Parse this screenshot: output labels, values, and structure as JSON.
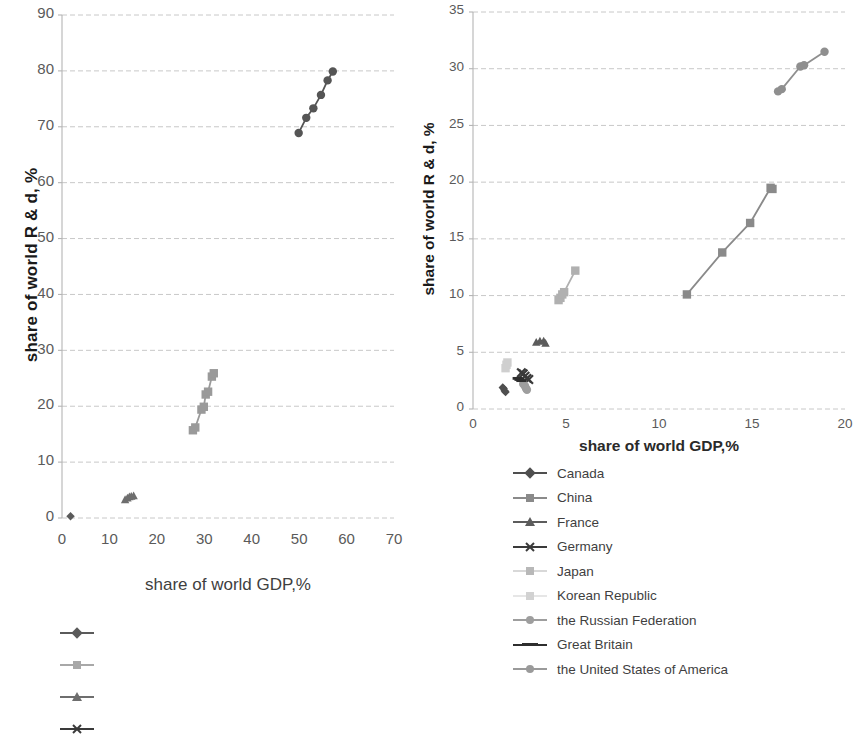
{
  "chart_data": [
    {
      "id": "chart-left",
      "type": "scatter",
      "title": "",
      "xlabel": "share of world GDP,%",
      "ylabel": "share of world R & d, %",
      "xlim": [
        0,
        70
      ],
      "ylim": [
        0,
        90
      ],
      "xticks": [
        0,
        10,
        20,
        30,
        40,
        50,
        60,
        70
      ],
      "yticks": [
        0,
        10,
        20,
        30,
        40,
        50,
        60,
        70,
        80,
        90
      ],
      "grid": "horizontal",
      "legend_position": "bottom-left (cropped, markers only)",
      "series": [
        {
          "name": "Canada",
          "color": "#5a5a5a",
          "marker": "diamond",
          "points": [
            [
              1.8,
              0.3
            ]
          ]
        },
        {
          "name": "China",
          "color": "#9a9a9a",
          "marker": "square",
          "points": [
            [
              27.6,
              15.7
            ],
            [
              28.1,
              16.2
            ],
            [
              29.4,
              19.4
            ],
            [
              29.9,
              19.9
            ],
            [
              30.3,
              22.1
            ],
            [
              30.8,
              22.6
            ],
            [
              31.6,
              25.3
            ],
            [
              32.0,
              25.9
            ]
          ]
        },
        {
          "name": "France",
          "color": "#6e6e6e",
          "marker": "triangle",
          "points": [
            [
              13.3,
              3.3
            ],
            [
              13.8,
              3.6
            ],
            [
              14.2,
              3.8
            ],
            [
              14.6,
              3.9
            ],
            [
              15.1,
              4.0
            ]
          ]
        },
        {
          "name": "the United States of America",
          "color": "#555555",
          "marker": "circle",
          "points": [
            [
              49.9,
              68.9
            ],
            [
              51.5,
              71.6
            ],
            [
              53.0,
              73.3
            ],
            [
              54.6,
              75.7
            ],
            [
              56.0,
              78.3
            ],
            [
              57.1,
              79.9
            ]
          ]
        }
      ]
    },
    {
      "id": "chart-right",
      "type": "scatter",
      "title": "",
      "xlabel": "share of world GDP,%",
      "ylabel": "share of world R & d, %",
      "xlim": [
        0,
        20
      ],
      "ylim": [
        0,
        35
      ],
      "xticks": [
        0,
        5,
        10,
        15,
        20
      ],
      "yticks": [
        0,
        5,
        10,
        15,
        20,
        25,
        30,
        35
      ],
      "grid": "horizontal",
      "legend_position": "below-axis",
      "series": [
        {
          "name": "Canada",
          "color": "#4f4f4f",
          "marker": "diamond",
          "points": [
            [
              1.6,
              1.9
            ],
            [
              1.65,
              1.8
            ],
            [
              1.7,
              1.6
            ],
            [
              1.75,
              1.5
            ]
          ]
        },
        {
          "name": "China",
          "color": "#8a8a8a",
          "marker": "square",
          "points": [
            [
              11.5,
              10.1
            ],
            [
              13.4,
              13.8
            ],
            [
              14.9,
              16.4
            ],
            [
              16.0,
              19.5
            ],
            [
              16.1,
              19.4
            ]
          ]
        },
        {
          "name": "France",
          "color": "#5c5c5c",
          "marker": "triangle",
          "points": [
            [
              3.4,
              5.9
            ],
            [
              3.6,
              6.0
            ],
            [
              3.8,
              6.0
            ],
            [
              3.9,
              5.8
            ]
          ]
        },
        {
          "name": "Germany",
          "color": "#3a3a3a",
          "marker": "cross",
          "points": [
            [
              2.6,
              3.2
            ],
            [
              2.7,
              3.1
            ],
            [
              2.8,
              2.9
            ],
            [
              2.9,
              2.7
            ],
            [
              3.0,
              2.6
            ]
          ]
        },
        {
          "name": "Japan",
          "color": "#b0b0b0",
          "marker": "square",
          "points": [
            [
              4.6,
              9.6
            ],
            [
              4.7,
              9.8
            ],
            [
              4.8,
              10.1
            ],
            [
              4.9,
              10.3
            ],
            [
              5.5,
              12.2
            ]
          ]
        },
        {
          "name": "Korean Republic",
          "color": "#cfcfcf",
          "marker": "square",
          "points": [
            [
              1.75,
              3.6
            ],
            [
              1.8,
              3.9
            ],
            [
              1.85,
              4.1
            ]
          ]
        },
        {
          "name": "the Russian Federation",
          "color": "#9e9e9e",
          "marker": "circle",
          "points": [
            [
              2.7,
              2.2
            ],
            [
              2.8,
              2.0
            ],
            [
              2.85,
              1.8
            ],
            [
              2.9,
              1.7
            ]
          ]
        },
        {
          "name": "Great Britain",
          "color": "#2e2e2e",
          "marker": "line",
          "points": [
            [
              2.4,
              2.7
            ],
            [
              2.5,
              2.6
            ],
            [
              2.6,
              2.5
            ]
          ]
        },
        {
          "name": "the United States of America",
          "color": "#8f8f8f",
          "marker": "circle",
          "points": [
            [
              16.4,
              28.0
            ],
            [
              16.6,
              28.2
            ],
            [
              17.6,
              30.2
            ],
            [
              17.8,
              30.3
            ],
            [
              18.9,
              31.5
            ]
          ]
        }
      ]
    }
  ],
  "chart_left": {
    "ylabel": "share of world R & d, %",
    "xlabel": "share of world GDP,%",
    "ytick_labels": [
      "90",
      "80",
      "70",
      "60",
      "50",
      "40",
      "30",
      "20",
      "10",
      "0"
    ],
    "xtick_labels": [
      "0",
      "10",
      "20",
      "30",
      "40",
      "50",
      "60",
      "70"
    ]
  },
  "chart_right": {
    "ylabel": "share of world R & d, %",
    "xlabel": "share of world GDP,%",
    "ytick_labels": [
      "35",
      "30",
      "25",
      "20",
      "15",
      "10",
      "5",
      "0"
    ],
    "xtick_labels": [
      "0",
      "5",
      "10",
      "15",
      "20"
    ]
  },
  "legend": {
    "items": [
      {
        "label": "Canada",
        "color": "#4f4f4f",
        "marker": "diamond"
      },
      {
        "label": "China",
        "color": "#8a8a8a",
        "marker": "square"
      },
      {
        "label": "France",
        "color": "#5c5c5c",
        "marker": "triangle"
      },
      {
        "label": "Germany",
        "color": "#3a3a3a",
        "marker": "cross"
      },
      {
        "label": "Japan",
        "color": "#b8b8b8",
        "marker": "square"
      },
      {
        "label": "Korean Republic",
        "color": "#d2d2d2",
        "marker": "square"
      },
      {
        "label": "the Russian Federation",
        "color": "#9e9e9e",
        "marker": "circle"
      },
      {
        "label": "Great Britain",
        "color": "#2e2e2e",
        "marker": "line"
      },
      {
        "label": "the United States of America",
        "color": "#9a9a9a",
        "marker": "circle"
      }
    ]
  },
  "legend_orphan": {
    "items": [
      {
        "label": "",
        "color": "#5a5a5a",
        "marker": "diamond"
      },
      {
        "label": "",
        "color": "#a8a8a8",
        "marker": "square"
      },
      {
        "label": "",
        "color": "#6e6e6e",
        "marker": "triangle"
      },
      {
        "label": "",
        "color": "#3a3a3a",
        "marker": "cross"
      }
    ]
  },
  "colors": {
    "grid": "#c8c8c8",
    "axis": "#b5b5b5",
    "text": "#3f3f3f",
    "title": "#1a1a1a"
  }
}
